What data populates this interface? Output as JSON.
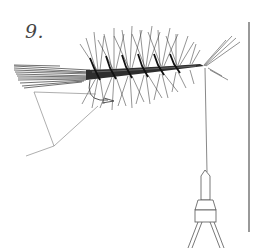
{
  "figure": {
    "step_label": "9.",
    "colors": {
      "ink": "#2a2a2a",
      "light_ink": "#666666",
      "background": "#ffffff"
    }
  }
}
